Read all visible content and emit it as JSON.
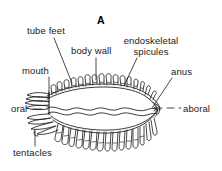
{
  "figure": {
    "panel_letter": "A",
    "background_color": "#ffffff",
    "line_color": "#1a1a1a",
    "width": 222,
    "height": 171
  },
  "labels": {
    "tube_feet": "tube feet",
    "body_wall": "body wall",
    "endoskeletal_spicules": "endoskeletal spicules",
    "endoskeletal_line1": "endoskeletal",
    "endoskeletal_line2": "spicules",
    "mouth": "mouth",
    "anus": "anus",
    "oral": "oral",
    "aboral": "aboral",
    "tentacles": "tentacles"
  },
  "axis": {
    "orientation": "oral-aboral",
    "left_end_label": "oral",
    "right_end_label": "aboral",
    "style": "dashed"
  },
  "anatomy": {
    "dorsal_podia_count": 16,
    "ventral_podia_count": 22,
    "oral_tentacle_tiers": 5,
    "internal_wavy_lines": 2
  }
}
